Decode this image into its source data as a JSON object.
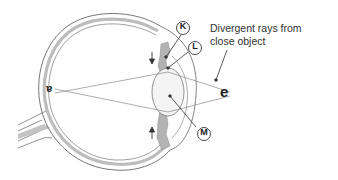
{
  "diagram": {
    "caption": {
      "line1": "Divergent rays from",
      "line2": "close object"
    },
    "labels": {
      "k": "K",
      "l": "L",
      "m": "M"
    },
    "object_letter": "e",
    "image_letter": "a",
    "arrows": {
      "top": "↓",
      "bottom": "↑"
    },
    "colors": {
      "line": "#555555",
      "tissue_fill": "#b8b8b8",
      "background": "#ffffff"
    }
  }
}
